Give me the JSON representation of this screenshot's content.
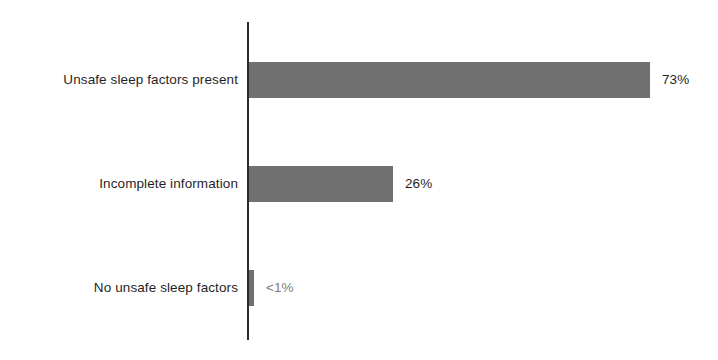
{
  "chart_data": {
    "type": "bar",
    "orientation": "horizontal",
    "title": "",
    "subtitle": "",
    "xlabel": "",
    "ylabel": "",
    "grid": false,
    "legend": false,
    "axis_visible": true,
    "xlim": [
      0,
      80
    ],
    "categories": [
      "Unsafe sleep factors present",
      "Incomplete information",
      "No unsafe sleep factors"
    ],
    "values": [
      73,
      26,
      0.5
    ],
    "value_labels": [
      "73%",
      "26%",
      "<1%"
    ],
    "bar_color": "#707070",
    "axis_color": "#2b2b2b",
    "label_color": "#1f1f1f",
    "muted_label_color": "#7a7a7a",
    "background_color": "#ffffff"
  },
  "bars": [
    {
      "category": "Unsafe sleep factors present",
      "value_label": "73%",
      "width_px": 401,
      "top_px": 62,
      "muted": false
    },
    {
      "category": "Incomplete information",
      "value_label": "26%",
      "width_px": 144,
      "top_px": 166,
      "muted": false
    },
    {
      "category": "No unsafe sleep factors",
      "value_label": "<1%",
      "width_px": 5,
      "top_px": 270,
      "muted": true
    }
  ]
}
